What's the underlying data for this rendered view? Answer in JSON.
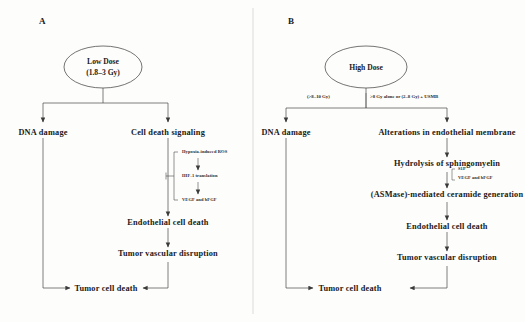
{
  "figure": {
    "background_color": "#fdfdfb",
    "line_color": "#3a3a3a",
    "divider_present": true
  },
  "panels": [
    {
      "letter": "A",
      "source_node": {
        "shape": "ellipse",
        "line1": "Low Dose",
        "line2": "(1.8–3 Gy)"
      },
      "nodes": {
        "dna_damage": "DNA damage",
        "cell_death_signaling": "Cell death signaling",
        "endothelial_cell_death": "Endothelial  cell death",
        "tumor_vascular_disruption": "Tumor vascular disruption",
        "tumor_cell_death": "Tumor cell death"
      },
      "annotations": {
        "hypoxia_ros": "Hypoxia-induced ROS",
        "hif1_translation": "HIF-1 translation",
        "vegf_bfgf": "VEGF and bFGF"
      }
    },
    {
      "letter": "B",
      "source_node": {
        "shape": "ellipse",
        "line1": "High Dose",
        "line2": ""
      },
      "branch_labels": {
        "left": "(>8–10 Gy)",
        "right": ">8 Gy alone or (2–8 Gy) + USMB"
      },
      "nodes": {
        "dna_damage": "DNA damage",
        "endothelial_membrane": "Alterations in endothelial membrane",
        "hydrolysis": "Hydrolysis of sphingomyelin",
        "ceramide": "(ASMase)-mediated ceramide generation",
        "endothelial_cell_death": "Endothelial  cell death",
        "tumor_vascular_disruption": "Tumor vascular disruption",
        "tumor_cell_death": "Tumor cell death"
      },
      "annotations": {
        "s1p": "S1P",
        "vegf_bfgf": "VEGF and bFGF"
      }
    }
  ]
}
